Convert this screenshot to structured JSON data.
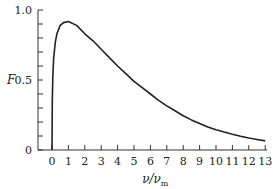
{
  "chart_data": {
    "type": "line",
    "title": "",
    "xlabel": "ν/ν_m",
    "xlabel_main": "ν/ν",
    "xlabel_sub": "m",
    "ylabel": "F",
    "xlim": [
      0,
      13
    ],
    "ylim": [
      0,
      1.0
    ],
    "x_ticks": [
      0,
      1,
      2,
      3,
      4,
      5,
      6,
      7,
      8,
      9,
      10,
      11,
      12,
      13
    ],
    "y_tick_labels": [
      "0",
      "0.5",
      "1.0"
    ],
    "y_ticks_major": [
      0,
      0.5,
      1.0
    ],
    "y_minor_step": 0.1,
    "grid": false,
    "legend": null,
    "series": [
      {
        "name": "F",
        "x": [
          0,
          0.02,
          0.05,
          0.1,
          0.2,
          0.3,
          0.5,
          0.7,
          1.0,
          1.5,
          2,
          2.5,
          3,
          3.5,
          4,
          4.5,
          5,
          5.5,
          6,
          6.5,
          7,
          7.5,
          8,
          8.5,
          9,
          9.5,
          10,
          10.5,
          11,
          11.5,
          12,
          12.5,
          13
        ],
        "values": [
          0,
          0.35,
          0.52,
          0.65,
          0.77,
          0.83,
          0.89,
          0.91,
          0.918,
          0.89,
          0.83,
          0.78,
          0.72,
          0.66,
          0.6,
          0.545,
          0.49,
          0.445,
          0.4,
          0.355,
          0.315,
          0.28,
          0.245,
          0.215,
          0.19,
          0.165,
          0.145,
          0.128,
          0.112,
          0.098,
          0.086,
          0.075,
          0.065
        ]
      }
    ]
  }
}
